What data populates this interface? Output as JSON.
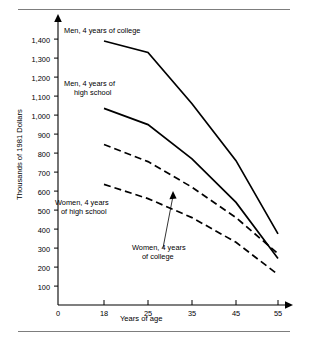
{
  "figure": {
    "ylabel": "Thousands of 1981 Dollars",
    "xlabel": "Years of age"
  },
  "annotations": {
    "men_college": "Men, 4 years of college",
    "men_hs_line1": "Men, 4 years of",
    "men_hs_line2": "high school",
    "women_hs_line1": "Women, 4 years",
    "women_hs_line2": "of high school",
    "women_college_line1": "Women, 4 years",
    "women_college_line2": "of college"
  },
  "chart_data": {
    "type": "line",
    "title": "",
    "xlabel": "Years of age",
    "ylabel": "Thousands of 1981 Dollars",
    "x": [
      18,
      25,
      35,
      45,
      55
    ],
    "xticklabels": [
      "0",
      "18",
      "25",
      "35",
      "45",
      "55"
    ],
    "yticklabels": [
      "1,400",
      "1,300",
      "1,200",
      "1,100",
      "1,000",
      "900",
      "800",
      "700",
      "600",
      "500",
      "400",
      "300",
      "200",
      "100"
    ],
    "ylim": [
      0,
      1450
    ],
    "xlim_categories": [
      "0",
      "18",
      "25",
      "35",
      "45",
      "55"
    ],
    "grid": false,
    "legend": "inline-annotations",
    "series": [
      {
        "name": "Men, 4 years of college",
        "style": "solid",
        "color": "#000000",
        "values": [
          1390,
          1330,
          1060,
          760,
          375
        ]
      },
      {
        "name": "Men, 4 years of high school",
        "style": "solid",
        "color": "#000000",
        "values": [
          1035,
          950,
          770,
          540,
          245
        ]
      },
      {
        "name": "Women, 4 years of college",
        "style": "dashed",
        "color": "#000000",
        "values": [
          845,
          755,
          620,
          460,
          270
        ]
      },
      {
        "name": "Women, 4 years of high school",
        "style": "dashed",
        "color": "#000000",
        "values": [
          635,
          560,
          460,
          330,
          160
        ]
      }
    ]
  }
}
